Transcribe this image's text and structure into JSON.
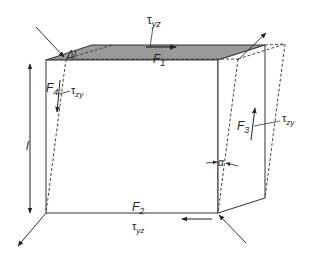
{
  "diagram": {
    "colors": {
      "line": "#333333",
      "top_face": "#9a9a9a",
      "dashed": "#444444",
      "background": "#ffffff"
    },
    "labels": {
      "tau_yz_top": "τ",
      "tau_yz_top_sub": "yz",
      "F1": "F",
      "F1_sub": "1",
      "delta_l": "Δl",
      "F4": "F",
      "F4_sub": "4",
      "tau_zy_left": "τ",
      "tau_zy_left_sub": "zy",
      "l": "l",
      "F3": "F",
      "F3_sub": "3",
      "tau_zy_right": "τ",
      "tau_zy_right_sub": "zy",
      "alpha": "α",
      "F2": "F",
      "F2_sub": "2",
      "tau_yz_bottom": "τ",
      "tau_yz_bottom_sub": "yz"
    }
  }
}
